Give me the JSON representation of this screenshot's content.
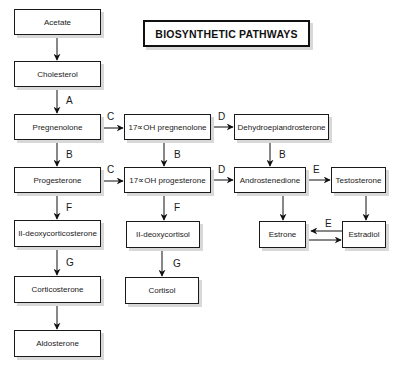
{
  "title": "BIOSYNTHETIC PATHWAYS",
  "nodes": {
    "acetate": "Acetate",
    "cholesterol": "Cholesterol",
    "pregnenolone": "Pregnenolone",
    "oh17_pregnenolone": "17∝OH pregnenolone",
    "dhea": "Dehydroepiandrosterone",
    "progesterone": "Progesterone",
    "oh17_progesterone": "17∝OH progesterone",
    "androstenedione": "Androstenedione",
    "testosterone": "Testosterone",
    "deoxycorticosterone": "II-deoxycorticosterone",
    "deoxycortisol": "II-deoxycortisol",
    "estrone": "Estrone",
    "estradiol": "Estradiol",
    "corticosterone": "Corticosterone",
    "cortisol": "Cortisol",
    "aldosterone": "Aldosterone"
  },
  "edge_labels": {
    "cholesterol_pregnenolone": "A",
    "pregnenolone_progesterone": "B",
    "oh17preg_oh17prog": "B",
    "dhea_androstenedione": "B",
    "pregnenolone_oh17preg": "C",
    "progesterone_oh17prog": "C",
    "oh17preg_dhea": "D",
    "oh17prog_androstenedione": "D",
    "androstenedione_testosterone": "E",
    "estradiol_estrone": "E",
    "progesterone_deoxycorticosterone": "F",
    "oh17prog_deoxycortisol": "F",
    "deoxycorticosterone_corticosterone": "G",
    "deoxycortisol_cortisol": "G"
  },
  "edges": [
    [
      "Acetate",
      "Cholesterol",
      ""
    ],
    [
      "Cholesterol",
      "Pregnenolone",
      "A"
    ],
    [
      "Pregnenolone",
      "17∝OH pregnenolone",
      "C"
    ],
    [
      "17∝OH pregnenolone",
      "Dehydroepiandrosterone",
      "D"
    ],
    [
      "Pregnenolone",
      "Progesterone",
      "B"
    ],
    [
      "17∝OH pregnenolone",
      "17∝OH progesterone",
      "B"
    ],
    [
      "Dehydroepiandrosterone",
      "Androstenedione",
      "B"
    ],
    [
      "Progesterone",
      "17∝OH progesterone",
      "C"
    ],
    [
      "17∝OH progesterone",
      "Androstenedione",
      "D"
    ],
    [
      "Androstenedione",
      "Testosterone",
      "E"
    ],
    [
      "Progesterone",
      "II-deoxycorticosterone",
      "F"
    ],
    [
      "17∝OH progesterone",
      "II-deoxycortisol",
      "F"
    ],
    [
      "Androstenedione",
      "Estrone",
      ""
    ],
    [
      "Testosterone",
      "Estradiol",
      ""
    ],
    [
      "Estradiol",
      "Estrone",
      "E"
    ],
    [
      "Estrone",
      "Estradiol",
      ""
    ],
    [
      "II-deoxycorticosterone",
      "Corticosterone",
      "G"
    ],
    [
      "II-deoxycortisol",
      "Cortisol",
      "G"
    ],
    [
      "Corticosterone",
      "Aldosterone",
      ""
    ]
  ]
}
